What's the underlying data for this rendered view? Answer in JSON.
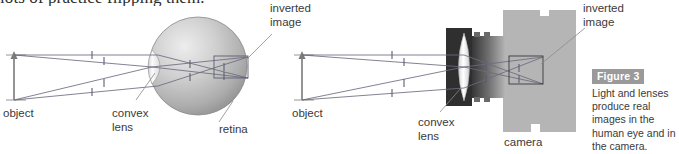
{
  "page": {
    "bleed_text": "lots of practice flipping them."
  },
  "figure": {
    "badge_label": "Figure 3",
    "caption": "Light and lenses produce real images in the human eye and in the camera."
  },
  "eye_diagram": {
    "labels": {
      "object": "object",
      "convex_lens": "convex lens",
      "convex_lens_line1": "convex",
      "convex_lens_line2": "lens",
      "retina": "retina",
      "inverted_image_line1": "inverted",
      "inverted_image_line2": "image"
    },
    "colors": {
      "sphere_light": "#e8e8e8",
      "sphere_mid": "#b9b9b9",
      "sphere_dark": "#8f8f8f",
      "lens": "#f4f4f4",
      "ray": "#6b6b80",
      "label_text": "#3a3a3a"
    }
  },
  "camera_diagram": {
    "labels": {
      "object": "object",
      "convex_lens_line1": "convex",
      "convex_lens_line2": "lens",
      "camera": "camera",
      "inverted_image_line1": "inverted",
      "inverted_image_line2": "image"
    },
    "colors": {
      "body_light": "#b5b5b5",
      "body_dark": "#3d3d3d",
      "lens": "#ffffff",
      "ray": "#6b6b80",
      "label_text": "#3a3a3a"
    }
  }
}
